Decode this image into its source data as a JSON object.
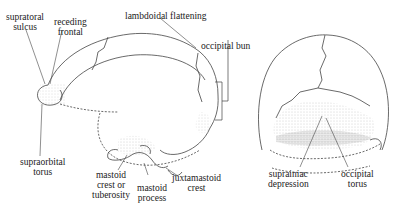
{
  "figure": {
    "left_view": "lateral view of skull",
    "right_view": "posterior view of skull"
  },
  "labels": {
    "supratoral_sulcus": [
      "supratoral",
      "sulcus"
    ],
    "receding_frontal": [
      "receding",
      "frontal"
    ],
    "lambdoidal_flattening": "lambdoidal flattening",
    "occipital_bun": "occipital bun",
    "supraorbital_torus": [
      "supraorbital",
      "torus"
    ],
    "mastoid_crest": [
      "mastoid",
      "crest or",
      "tuberosity"
    ],
    "mastoid_process": [
      "mastoid",
      "process"
    ],
    "juxtamastoid_crest": [
      "juxtamastoid",
      "crest"
    ],
    "suprainiac_depression": [
      "suprainiac",
      "depression"
    ],
    "occipital_torus": [
      "occipital",
      "torus"
    ]
  }
}
